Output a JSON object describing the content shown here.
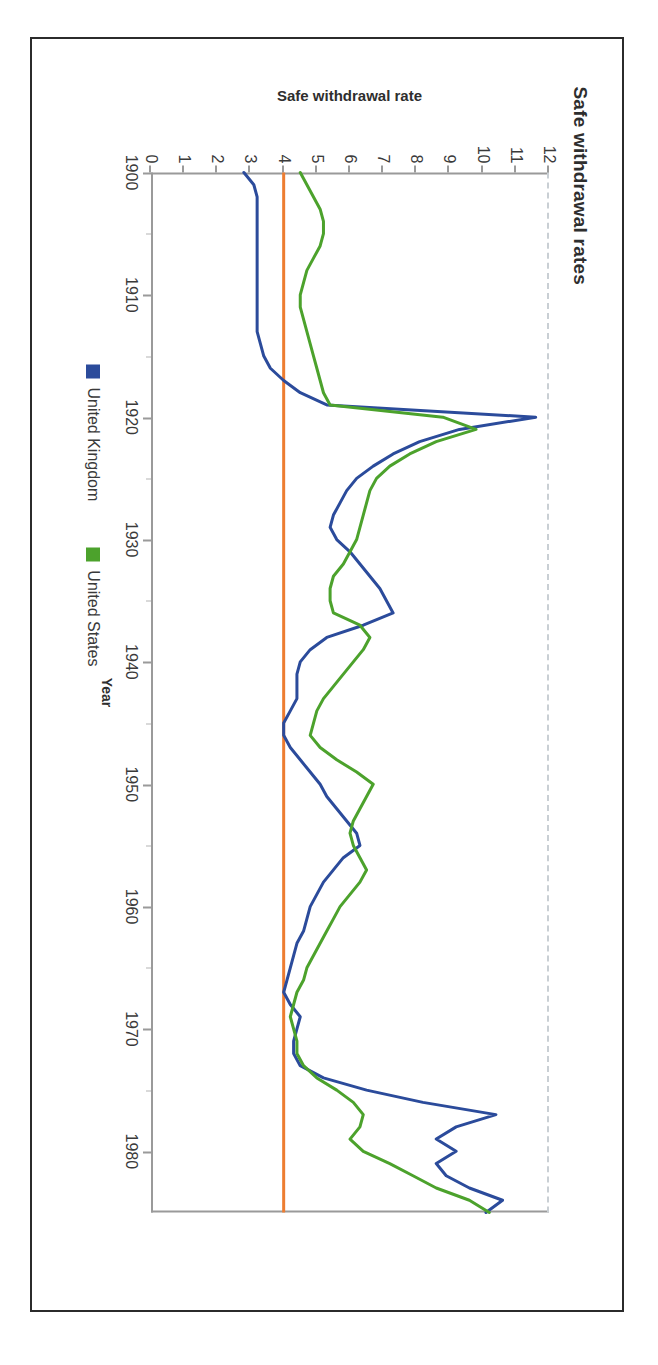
{
  "page": {
    "document_type": "scanned-page",
    "border_color": "#2b2b2b",
    "background": "#ffffff"
  },
  "chart": {
    "title": "Safe withdrawal rates",
    "x_axis_title": "Year",
    "y_axis_title": "Safe withdrawal rate",
    "legend": [
      {
        "label": "United Kingdom",
        "color": "#2b4b9b",
        "marker": "square"
      },
      {
        "label": "United States",
        "color": "#4ca22c",
        "marker": "square"
      }
    ],
    "reference_line": {
      "name": "four-percent-rule",
      "value": 4,
      "color": "#ed7d31",
      "orientation": "horizontal"
    },
    "top_boundary_line": {
      "color": "#c9cfd4",
      "style": "dashed"
    }
  },
  "chart_data": {
    "type": "line",
    "title": "Safe withdrawal rates",
    "xlabel": "Year",
    "ylabel": "Safe withdrawal rate",
    "xlim": [
      1900,
      1985
    ],
    "ylim": [
      0,
      12
    ],
    "xticks": [
      1900,
      1910,
      1920,
      1930,
      1940,
      1950,
      1960,
      1970,
      1980
    ],
    "yticks": [
      0,
      1,
      2,
      3,
      4,
      5,
      6,
      7,
      8,
      9,
      10,
      11,
      12
    ],
    "grid": false,
    "legend_position": "bottom",
    "reference_lines": [
      {
        "name": "4% rule",
        "axis": "y",
        "value": 4,
        "color": "#ed7d31"
      }
    ],
    "x": [
      1900,
      1901,
      1902,
      1903,
      1904,
      1905,
      1906,
      1907,
      1908,
      1909,
      1910,
      1911,
      1912,
      1913,
      1914,
      1915,
      1916,
      1917,
      1918,
      1919,
      1920,
      1921,
      1922,
      1923,
      1924,
      1925,
      1926,
      1927,
      1928,
      1929,
      1930,
      1931,
      1932,
      1933,
      1934,
      1935,
      1936,
      1937,
      1938,
      1939,
      1940,
      1941,
      1942,
      1943,
      1944,
      1945,
      1946,
      1947,
      1948,
      1949,
      1950,
      1951,
      1952,
      1953,
      1954,
      1955,
      1956,
      1957,
      1958,
      1959,
      1960,
      1961,
      1962,
      1963,
      1964,
      1965,
      1966,
      1967,
      1968,
      1969,
      1970,
      1971,
      1972,
      1973,
      1974,
      1975,
      1976,
      1977,
      1978,
      1979,
      1980,
      1981,
      1982,
      1983,
      1984,
      1985
    ],
    "series": [
      {
        "name": "United Kingdom",
        "color": "#2b4b9b",
        "values": [
          2.8,
          3.1,
          3.2,
          3.2,
          3.2,
          3.2,
          3.2,
          3.2,
          3.2,
          3.2,
          3.2,
          3.2,
          3.2,
          3.2,
          3.3,
          3.4,
          3.6,
          4.0,
          4.5,
          5.3,
          11.6,
          9.3,
          8.1,
          7.3,
          6.7,
          6.2,
          5.9,
          5.7,
          5.5,
          5.4,
          5.6,
          6.0,
          6.3,
          6.6,
          6.9,
          7.1,
          7.3,
          6.4,
          5.3,
          4.8,
          4.5,
          4.4,
          4.4,
          4.4,
          4.2,
          4.0,
          4.0,
          4.2,
          4.5,
          4.8,
          5.1,
          5.3,
          5.6,
          5.9,
          6.2,
          6.3,
          5.8,
          5.5,
          5.2,
          5.0,
          4.8,
          4.7,
          4.6,
          4.4,
          4.3,
          4.2,
          4.1,
          4.0,
          4.2,
          4.5,
          4.4,
          4.3,
          4.3,
          4.5,
          5.2,
          6.5,
          8.2,
          10.4,
          9.2,
          8.6,
          9.2,
          8.6,
          8.9,
          9.6,
          10.6,
          10.1
        ]
      },
      {
        "name": "United States",
        "color": "#4ca22c",
        "values": [
          4.5,
          4.7,
          4.9,
          5.1,
          5.2,
          5.2,
          5.1,
          4.9,
          4.7,
          4.6,
          4.5,
          4.5,
          4.6,
          4.7,
          4.8,
          4.9,
          5.0,
          5.1,
          5.2,
          5.4,
          8.8,
          9.8,
          8.6,
          7.8,
          7.2,
          6.8,
          6.6,
          6.5,
          6.4,
          6.3,
          6.2,
          6.0,
          5.8,
          5.5,
          5.4,
          5.4,
          5.5,
          6.3,
          6.6,
          6.4,
          6.1,
          5.8,
          5.5,
          5.2,
          5.0,
          4.9,
          4.8,
          5.1,
          5.6,
          6.2,
          6.7,
          6.5,
          6.3,
          6.1,
          6.0,
          6.1,
          6.3,
          6.5,
          6.3,
          6.0,
          5.7,
          5.5,
          5.3,
          5.1,
          4.9,
          4.7,
          4.6,
          4.4,
          4.3,
          4.2,
          4.3,
          4.4,
          4.4,
          4.6,
          5.0,
          5.6,
          6.1,
          6.4,
          6.3,
          6.0,
          6.4,
          7.2,
          7.9,
          8.6,
          9.6,
          10.2
        ]
      }
    ]
  }
}
